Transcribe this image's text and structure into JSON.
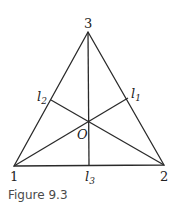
{
  "figure": {
    "caption": "Figure 9.3",
    "vertices": [
      {
        "label": "1",
        "x": 14,
        "y": 166
      },
      {
        "label": "2",
        "x": 164,
        "y": 165
      },
      {
        "label": "3",
        "x": 88,
        "y": 32
      }
    ],
    "center_label": "O",
    "foot_labels": {
      "l1": {
        "base": "l",
        "sub": "1"
      },
      "l2": {
        "base": "l",
        "sub": "2"
      },
      "l3": {
        "base": "l",
        "sub": "3"
      }
    }
  }
}
